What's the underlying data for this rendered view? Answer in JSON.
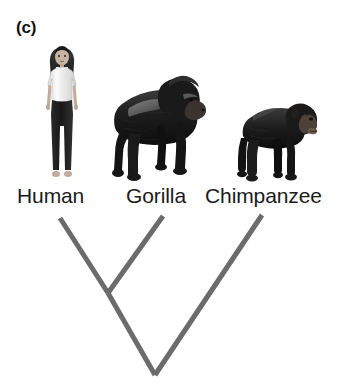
{
  "figure": {
    "panel_label": "(c)",
    "background_color": "#ffffff",
    "width": 357,
    "height": 384
  },
  "taxa": [
    {
      "id": "human",
      "label": "Human",
      "icon_name": "human-photo",
      "description": "standing woman, white t-shirt, dark trousers, dark long hair"
    },
    {
      "id": "gorilla",
      "label": "Gorilla",
      "icon_name": "gorilla-photo",
      "description": "silverback gorilla on knuckles facing right"
    },
    {
      "id": "chimpanzee",
      "label": "Chimpanzee",
      "icon_name": "chimpanzee-photo",
      "description": "chimpanzee on knuckles facing right"
    }
  ],
  "chart_data": {
    "type": "tree",
    "title": "(c)",
    "tip_labels": [
      "Human",
      "Gorilla",
      "Chimpanzee"
    ],
    "topology": "((Human,Gorilla),Chimpanzee)",
    "nodes": [
      {
        "name": "Human",
        "type": "tip",
        "x": 60,
        "y": 218
      },
      {
        "name": "Gorilla",
        "type": "tip",
        "x": 163,
        "y": 216
      },
      {
        "name": "Chimpanzee",
        "type": "tip",
        "x": 262,
        "y": 215
      },
      {
        "name": "Human-Gorilla-ancestor",
        "type": "internal",
        "x": 108,
        "y": 293
      },
      {
        "name": "root",
        "type": "internal",
        "x": 155,
        "y": 375
      }
    ],
    "edges": [
      {
        "from": "Human-Gorilla-ancestor",
        "to": "Human"
      },
      {
        "from": "Human-Gorilla-ancestor",
        "to": "Gorilla"
      },
      {
        "from": "root",
        "to": "Human-Gorilla-ancestor"
      },
      {
        "from": "root",
        "to": "Chimpanzee"
      }
    ],
    "line_color": "#6b6b6b",
    "line_width": 5,
    "grid": false,
    "legend": "none"
  },
  "colors": {
    "branch": "#6b6b6b",
    "text": "#1b1b1b",
    "background": "#ffffff"
  }
}
